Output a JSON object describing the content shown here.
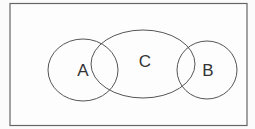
{
  "diagram": {
    "type": "venn",
    "sets": [
      {
        "id": "A",
        "label": "A"
      },
      {
        "id": "C",
        "label": "C"
      },
      {
        "id": "B",
        "label": "B"
      }
    ],
    "overlaps": [
      [
        "A",
        "C"
      ],
      [
        "C",
        "B"
      ]
    ],
    "colors": {
      "stroke": "#555555",
      "background": "#fdfdfd",
      "text": "#333333"
    }
  }
}
